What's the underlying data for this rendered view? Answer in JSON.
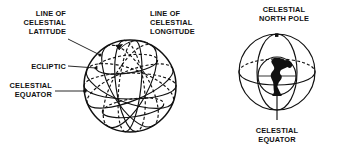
{
  "figure": {
    "background_color": "#ffffff",
    "ink_color": "#111111",
    "width": 346,
    "height": 151
  },
  "left_diagram": {
    "name": "celestial-coordinate-sphere",
    "labels": {
      "line_of_celestial_latitude": [
        "LINE OF",
        "CELESTIAL",
        "LATITUDE"
      ],
      "ecliptic": "ECLIPTIC",
      "celestial_equator": [
        "CELESTIAL",
        "EQUATOR"
      ],
      "line_of_celestial_longitude": [
        "LINE OF",
        "CELESTIAL",
        "LONGITUDE"
      ]
    },
    "sphere": {
      "center_x": 130,
      "center_y": 86,
      "radius": 46
    }
  },
  "right_diagram": {
    "name": "earth-in-celestial-sphere",
    "labels": {
      "celestial_north_pole": [
        "CELESTIAL",
        "NORTH POLE"
      ],
      "celestial_equator": [
        "CELESTIAL",
        "EQUATOR"
      ]
    },
    "sphere": {
      "center_x": 277,
      "center_y": 72,
      "radius": 38
    },
    "earth": {
      "center_x": 277,
      "center_y": 76,
      "radius": 19,
      "continents": "americas"
    },
    "pole_marker": {
      "x": 277,
      "y": 35,
      "shape": "square-dot"
    }
  }
}
